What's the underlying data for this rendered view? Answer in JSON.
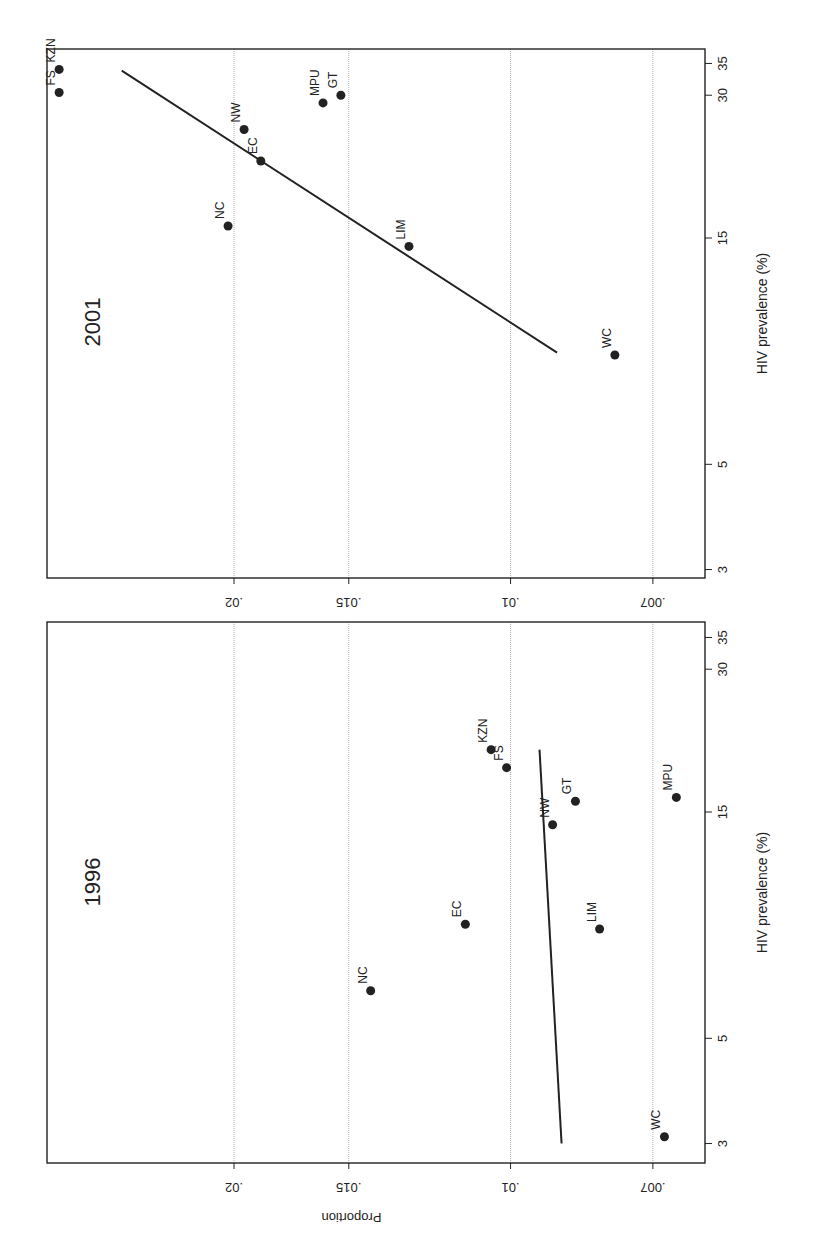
{
  "figure": {
    "orientation": "rotated-90-clockwise",
    "panels_order_top_to_bottom": [
      "2001",
      "1996"
    ]
  },
  "chart_data": [
    {
      "type": "scatter",
      "title": "2001",
      "xlabel": "HIV prevalence (%)",
      "ylabel": "Proportion",
      "x_scale": "log",
      "y_scale": "log",
      "x_ticks": [
        3,
        5,
        15,
        30,
        35
      ],
      "x_tick_labels": [
        "3",
        "5",
        "15",
        "30",
        "35"
      ],
      "y_ticks": [
        0.007,
        0.01,
        0.015,
        0.02
      ],
      "y_tick_labels": [
        ".007",
        ".01",
        ".015",
        ".02"
      ],
      "xlim": [
        2.9,
        36
      ],
      "ylim": [
        0.0066,
        0.032
      ],
      "grid": "horizontal dotted at y ticks",
      "points": [
        {
          "label": "KZN",
          "x": 34.0,
          "y": 0.031
        },
        {
          "label": "FS",
          "x": 30.4,
          "y": 0.031
        },
        {
          "label": "GT",
          "x": 30.0,
          "y": 0.0153
        },
        {
          "label": "MPU",
          "x": 28.9,
          "y": 0.016
        },
        {
          "label": "NW",
          "x": 25.4,
          "y": 0.0195
        },
        {
          "label": "EC",
          "x": 21.8,
          "y": 0.0187
        },
        {
          "label": "NC",
          "x": 15.9,
          "y": 0.0203
        },
        {
          "label": "LIM",
          "x": 14.4,
          "y": 0.0129
        },
        {
          "label": "WC",
          "x": 8.5,
          "y": 0.0077
        }
      ],
      "fit_line": {
        "x": [
          8.6,
          33.8
        ],
        "y": [
          0.0089,
          0.0265
        ]
      }
    },
    {
      "type": "scatter",
      "title": "1996",
      "xlabel": "HIV prevalence (%)",
      "ylabel": "Proportion",
      "x_scale": "log",
      "y_scale": "log",
      "x_ticks": [
        3,
        5,
        15,
        30,
        35
      ],
      "x_tick_labels": [
        "3",
        "5",
        "15",
        "30",
        "35"
      ],
      "y_ticks": [
        0.007,
        0.01,
        0.015,
        0.02
      ],
      "y_tick_labels": [
        ".007",
        ".01",
        ".015",
        ".02"
      ],
      "xlim": [
        2.9,
        36
      ],
      "ylim": [
        0.0066,
        0.032
      ],
      "grid": "horizontal dotted at y ticks",
      "points": [
        {
          "label": "KZN",
          "x": 20.3,
          "y": 0.0105
        },
        {
          "label": "FS",
          "x": 18.6,
          "y": 0.0101
        },
        {
          "label": "MPU",
          "x": 16.1,
          "y": 0.0066
        },
        {
          "label": "GT",
          "x": 15.8,
          "y": 0.0085
        },
        {
          "label": "NW",
          "x": 14.1,
          "y": 0.009
        },
        {
          "label": "EC",
          "x": 8.7,
          "y": 0.0112
        },
        {
          "label": "LIM",
          "x": 8.5,
          "y": 0.008
        },
        {
          "label": "NC",
          "x": 6.3,
          "y": 0.0142
        },
        {
          "label": "WC",
          "x": 3.1,
          "y": 0.0068
        }
      ],
      "fit_line": {
        "x": [
          3.0,
          20.3
        ],
        "y": [
          0.0088,
          0.0093
        ]
      }
    }
  ],
  "colors": {
    "ink": "#222222",
    "grid": "#9a9a9a",
    "background": "#ffffff"
  }
}
